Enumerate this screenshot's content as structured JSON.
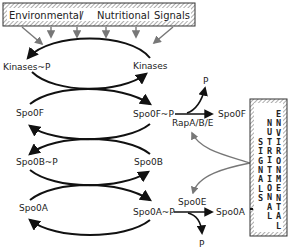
{
  "diagram": {
    "banner": {
      "word1": "Environmental",
      "sep": "/",
      "word2": "Nutritional",
      "word3": "Signals"
    },
    "side_box": {
      "col1": [
        "S",
        "I",
        "G",
        "N",
        "A",
        "L",
        "S"
      ],
      "col2": [
        "N",
        "U",
        "T",
        "R",
        "I",
        "T",
        "I",
        "O",
        "N",
        "A",
        "L"
      ],
      "col3": [
        "E",
        "N",
        "V",
        "I",
        "R",
        "O",
        "N",
        "M",
        "E",
        "N",
        "T",
        "A",
        "L"
      ]
    },
    "nodes": {
      "kinases_p": "Kinases~P",
      "kinases": "Kinases",
      "spo0f": "Spo0F",
      "spo0f_p": "Spo0F~P",
      "spo0b_p": "Spo0B~P",
      "spo0b": "Spo0B",
      "spo0a": "Spo0A",
      "spo0a_p": "Spo0A~P"
    },
    "side_reactions": {
      "rap": {
        "enzyme": "RapA/B/E",
        "product": "Spo0F",
        "released": "P"
      },
      "spo0e": {
        "enzyme": "Spo0E",
        "product": "Spo0A",
        "released": "P"
      }
    },
    "colors": {
      "line": "#111111",
      "signal_arrow": "#777777",
      "hatch": "#999999"
    }
  }
}
